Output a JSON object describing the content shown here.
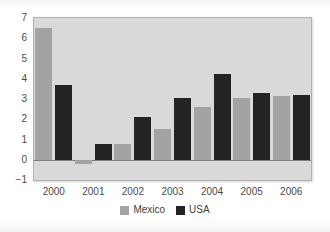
{
  "chart_data": {
    "type": "bar",
    "title": "",
    "subtitle": "",
    "xlabel": "",
    "ylabel": "",
    "categories": [
      "2000",
      "2001",
      "2002",
      "2003",
      "2004",
      "2005",
      "2006"
    ],
    "series": [
      {
        "name": "Mexico",
        "color": "#a3a3a3",
        "values": [
          6.5,
          -0.2,
          0.8,
          1.5,
          2.6,
          3.05,
          3.15
        ]
      },
      {
        "name": "USA",
        "color": "#232323",
        "values": [
          3.7,
          0.8,
          2.1,
          3.05,
          4.25,
          3.3,
          3.2
        ]
      }
    ],
    "ylim": [
      -1,
      7
    ],
    "yticks": [
      -1,
      0,
      1,
      2,
      3,
      4,
      5,
      6,
      7
    ],
    "ytick_labels": [
      "−1",
      "0",
      "1",
      "2",
      "3",
      "4",
      "5",
      "6",
      "7"
    ],
    "grid": false,
    "legend_position": "bottom",
    "plot_background": "#d9d9d9",
    "figure_background": "#fdfdfd",
    "axis_text_color": "#4a4a4a"
  }
}
